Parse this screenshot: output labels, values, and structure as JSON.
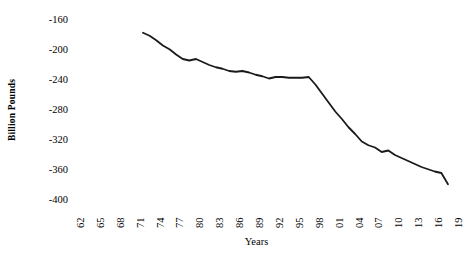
{
  "chart_data": {
    "type": "line",
    "title": "",
    "xlabel": "Years",
    "ylabel": "Billion Pounds",
    "grid": false,
    "legend": null,
    "xlim": [
      1962,
      2019
    ],
    "ylim": [
      -400,
      -160
    ],
    "yticks": [
      -160,
      -200,
      -240,
      -280,
      -320,
      -360,
      -400
    ],
    "ytick_labels": [
      "-160",
      "-200",
      "-240",
      "-280",
      "-320",
      "-360",
      "-400"
    ],
    "xtick_labels": [
      "62",
      "65",
      "68",
      "71",
      "74",
      "77",
      "80",
      "83",
      "86",
      "89",
      "92",
      "95",
      "98",
      "01",
      "04",
      "07",
      "10",
      "13",
      "16",
      "19"
    ],
    "xticks": [
      1962,
      1965,
      1968,
      1971,
      1974,
      1977,
      1980,
      1983,
      1986,
      1989,
      1992,
      1995,
      1998,
      2001,
      2004,
      2007,
      2010,
      2013,
      2016,
      2019
    ],
    "series": [
      {
        "name": "Billion Pounds",
        "color": "#1a1a1a",
        "line_width": 1.8,
        "x": [
          1973,
          1974,
          1975,
          1976,
          1977,
          1978,
          1979,
          1980,
          1981,
          1982,
          1983,
          1984,
          1985,
          1986,
          1987,
          1988,
          1989,
          1990,
          1991,
          1992,
          1993,
          1994,
          1995,
          1996,
          1997,
          1998,
          1999,
          2000,
          2001,
          2002,
          2003,
          2004,
          2005,
          2006,
          2007,
          2008,
          2009,
          2010,
          2011,
          2012,
          2013,
          2014,
          2015,
          2016,
          2017,
          2018,
          2019
        ],
        "y": [
          -177,
          -181,
          -187,
          -194,
          -199,
          -206,
          -212,
          -214,
          -212,
          -216,
          -220,
          -223,
          -225,
          -228,
          -229,
          -228,
          -230,
          -233,
          -235,
          -238,
          -236,
          -236,
          -237,
          -237,
          -237,
          -236,
          -246,
          -258,
          -270,
          -282,
          -292,
          -303,
          -312,
          -322,
          -327,
          -330,
          -336,
          -334,
          -340,
          -344,
          -348,
          -352,
          -356,
          -359,
          -362,
          -364,
          -379
        ]
      }
    ]
  }
}
